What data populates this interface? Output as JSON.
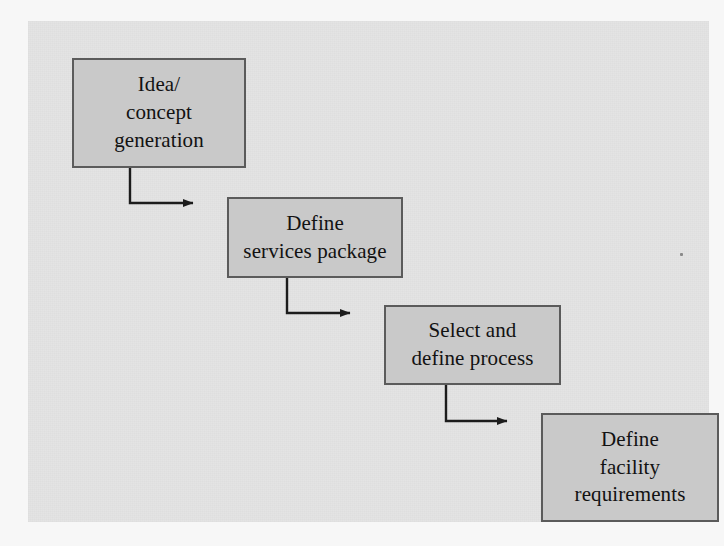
{
  "diagram": {
    "type": "flowchart",
    "orientation": "left-to-right cascading / descending staircase",
    "title": "",
    "background_color": "#e4e4e4",
    "page_color": "#f7f7f7",
    "node_fill_color": "#c9c9c9",
    "node_border_color": "#5b5b5b",
    "connector_color": "#1c1c1c",
    "nodes": [
      {
        "id": "idea",
        "label": "Idea/\nconcept\ngeneration",
        "lines": [
          "Idea/",
          "concept",
          "generation"
        ],
        "step": 1
      },
      {
        "id": "services",
        "label": "Define\nservices package",
        "lines": [
          "Define",
          "services package"
        ],
        "step": 2
      },
      {
        "id": "process",
        "label": "Select and\ndefine process",
        "lines": [
          "Select and",
          "define process"
        ],
        "step": 3
      },
      {
        "id": "facility",
        "label": "Define\nfacility\nrequirements",
        "lines": [
          "Define",
          "facility",
          "requirements"
        ],
        "step": 4
      }
    ],
    "edges": [
      {
        "id": "edge-1",
        "from": "idea",
        "to": "services",
        "style": "elbow-arrow"
      },
      {
        "id": "edge-2",
        "from": "services",
        "to": "process",
        "style": "elbow-arrow"
      },
      {
        "id": "edge-3",
        "from": "process",
        "to": "facility",
        "style": "elbow-arrow"
      }
    ]
  }
}
